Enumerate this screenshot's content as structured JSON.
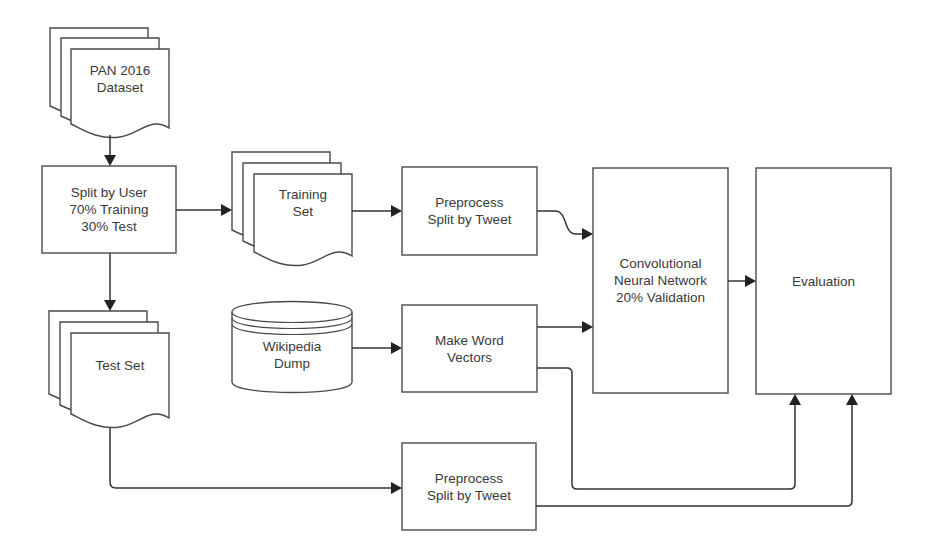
{
  "diagram": {
    "type": "flowchart",
    "nodes": {
      "pan_dataset": {
        "label": "PAN 2016\nDataset",
        "shape": "multi-document"
      },
      "split_by_user": {
        "label": "Split by User\n70% Training\n30% Test",
        "shape": "process"
      },
      "training_set": {
        "label": "Training\nSet",
        "shape": "multi-document"
      },
      "preprocess_train": {
        "label": "Preprocess\nSplit by Tweet",
        "shape": "process"
      },
      "wikipedia_dump": {
        "label": "Wikipedia\nDump",
        "shape": "database"
      },
      "make_word_vectors": {
        "label": "Make Word\nVectors",
        "shape": "process"
      },
      "cnn": {
        "label": "Convolutional\nNeural Network\n20% Validation",
        "shape": "process"
      },
      "evaluation": {
        "label": "Evaluation",
        "shape": "process"
      },
      "test_set": {
        "label": "Test Set",
        "shape": "multi-document"
      },
      "preprocess_test": {
        "label": "Preprocess\nSplit by Tweet",
        "shape": "process"
      }
    },
    "edges": [
      {
        "from": "pan_dataset",
        "to": "split_by_user"
      },
      {
        "from": "split_by_user",
        "to": "training_set"
      },
      {
        "from": "split_by_user",
        "to": "test_set"
      },
      {
        "from": "training_set",
        "to": "preprocess_train"
      },
      {
        "from": "preprocess_train",
        "to": "cnn"
      },
      {
        "from": "wikipedia_dump",
        "to": "make_word_vectors"
      },
      {
        "from": "make_word_vectors",
        "to": "cnn"
      },
      {
        "from": "make_word_vectors",
        "to": "evaluation"
      },
      {
        "from": "cnn",
        "to": "evaluation"
      },
      {
        "from": "test_set",
        "to": "preprocess_test"
      },
      {
        "from": "preprocess_test",
        "to": "evaluation"
      }
    ],
    "colors": {
      "stroke": "#4a4a4a",
      "edge": "#333333",
      "text": "#3a3a3a",
      "background": "#ffffff"
    }
  }
}
